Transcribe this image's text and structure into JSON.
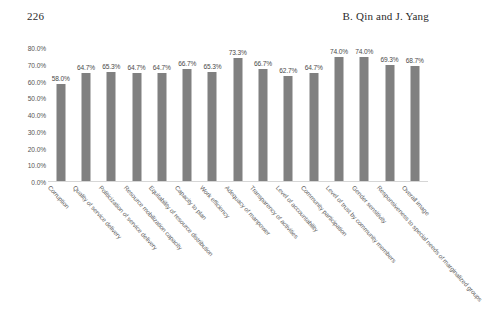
{
  "page": {
    "number": "226",
    "authors": "B. Qin and J. Yang"
  },
  "chart_data": {
    "type": "bar",
    "title": "",
    "xlabel": "",
    "ylabel": "",
    "ylim": [
      0,
      80
    ],
    "grid": false,
    "legend": "none",
    "y_ticks": [
      "80.0%",
      "70.0%",
      "60.0%",
      "50.0%",
      "40.0%",
      "30.0%",
      "20.0%",
      "10.0%",
      "0.0%"
    ],
    "y_tick_values": [
      80,
      70,
      60,
      50,
      40,
      30,
      20,
      10,
      0
    ],
    "bar_color": "#808080",
    "categories": [
      "Corruption",
      "Quality of service delivery",
      "Politicization of service delivery",
      "Resource mobilization capacity",
      "Equitability of resource distribution",
      "Capacity to plan",
      "Work efficiency",
      "Adequacy of manpower",
      "Transparency of activities",
      "Level of accountability",
      "Community participation",
      "Level of trust by community members",
      "Gender sensitivity",
      "Responsiveness to special needs of marginalized groups",
      "Overall image"
    ],
    "values": [
      58.0,
      64.7,
      65.3,
      64.7,
      64.7,
      66.7,
      65.3,
      73.3,
      66.7,
      62.7,
      64.7,
      74.0,
      74.0,
      69.3,
      68.7
    ],
    "value_labels": [
      "58.0%",
      "64.7%",
      "65.3%",
      "64.7%",
      "64.7%",
      "66.7%",
      "65.3%",
      "73.3%",
      "66.7%",
      "62.7%",
      "64.7%",
      "74.0%",
      "74.0%",
      "69.3%",
      "68.7%"
    ]
  }
}
